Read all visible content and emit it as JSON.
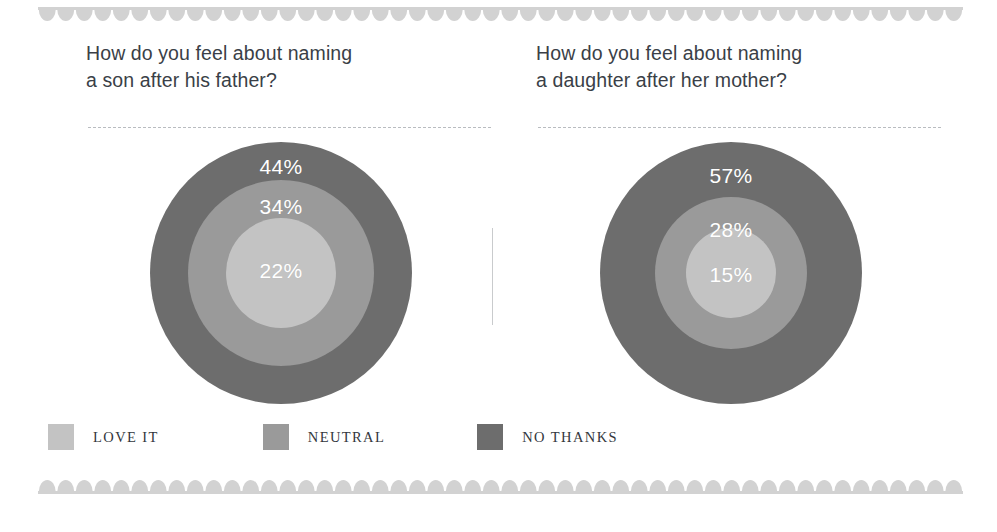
{
  "decor": {
    "scallop_color": "#d2d2d2",
    "divider_color": "#c9cbcd",
    "dashed_rule_color": "#b9bcc0"
  },
  "palette": {
    "love_it": "#c3c3c3",
    "neutral": "#9a9a9a",
    "no_thanks": "#6d6d6d",
    "title_text": "#3a3f47",
    "label_text": "#ffffff",
    "legend_text": "#33373d"
  },
  "panels": [
    {
      "title": "How do you feel about naming\na son after his father?",
      "labels": {
        "outer": "44%",
        "middle": "34%",
        "inner": "22%"
      }
    },
    {
      "title": "How do you feel about naming\na daughter after her mother?",
      "labels": {
        "outer": "57%",
        "middle": "28%",
        "inner": "15%"
      }
    }
  ],
  "legend": {
    "items": [
      {
        "label": "LOVE IT",
        "color": "#c3c3c3"
      },
      {
        "label": "NEUTRAL",
        "color": "#9a9a9a"
      },
      {
        "label": "NO THANKS",
        "color": "#6d6d6d"
      }
    ]
  },
  "chart_data": {
    "type": "pie",
    "title": "",
    "variant": "concentric-circles",
    "categories": [
      "NO THANKS",
      "NEUTRAL",
      "LOVE IT"
    ],
    "unit": "percent",
    "series": [
      {
        "name": "How do you feel about naming a son after his father?",
        "values": [
          44,
          34,
          22
        ]
      },
      {
        "name": "How do you feel about naming a daughter after her mother?",
        "values": [
          57,
          28,
          15
        ]
      }
    ],
    "legend_position": "bottom-left",
    "grid": false
  }
}
